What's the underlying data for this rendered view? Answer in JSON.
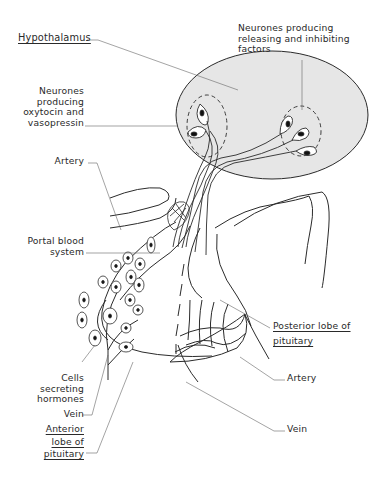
{
  "diagram": {
    "colors": {
      "hypothalamus_fill": "#e4e4e4",
      "line": "#2b2b2b",
      "leader": "#777777"
    },
    "labels": {
      "hypothalamus": "Hypothalamus",
      "releasing_neurones": [
        "Neurones producing",
        "releasing and inhibiting",
        "factors"
      ],
      "oxytocin_neurones": [
        "Neurones",
        "producing",
        "oxytocin and",
        "vasopressin"
      ],
      "artery_upper": "Artery",
      "portal_blood_system": [
        "Portal blood",
        "system"
      ],
      "posterior_lobe": [
        "Posterior lobe of",
        "pituitary"
      ],
      "artery_lower": "Artery",
      "cells_secreting": [
        "Cells",
        "secreting",
        "hormones"
      ],
      "vein_left": "Vein",
      "anterior_lobe": [
        "Anterior",
        "lobe of",
        "pituitary"
      ],
      "vein_right": "Vein"
    }
  }
}
